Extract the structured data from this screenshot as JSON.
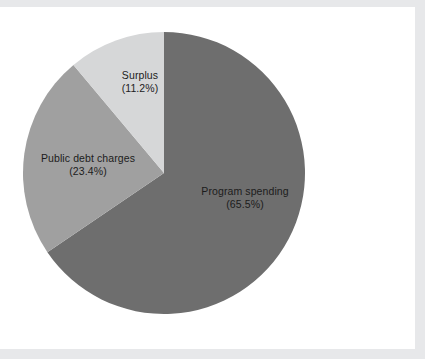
{
  "chart_data": {
    "type": "pie",
    "title": "",
    "subtitle": "",
    "xlabel": "",
    "ylabel": "",
    "legend_position": "none",
    "grid": false,
    "start_angle_deg": 0,
    "direction": "clockwise",
    "categories": [
      "Program spending",
      "Public debt charges",
      "Surplus"
    ],
    "values": [
      65.5,
      23.4,
      11.2
    ],
    "unit": "%",
    "slices": [
      {
        "name": "Program spending",
        "value": 65.5,
        "label_name": "Program spending",
        "label_pct": "(65.5%)",
        "color": "#6e6e6e",
        "start_deg": 0,
        "end_deg": 235.8
      },
      {
        "name": "Public debt charges",
        "value": 23.4,
        "label_name": "Public debt charges",
        "label_pct": "(23.4%)",
        "color": "#a0a0a0",
        "start_deg": 235.8,
        "end_deg": 320.04
      },
      {
        "name": "Surplus",
        "value": 11.2,
        "label_name": "Surplus",
        "label_pct": "(11.2%)",
        "color": "#d6d7d8",
        "start_deg": 320.04,
        "end_deg": 360
      }
    ]
  },
  "colors": {
    "program_spending": "#6e6e6e",
    "public_debt_charges": "#a0a0a0",
    "surplus": "#d6d7d8",
    "page_background": "#ffffff",
    "frame_band": "#e7e8ea",
    "label_text": "#1c1c1c"
  },
  "geometry": {
    "center_x": 164,
    "center_y": 166,
    "radius": 141
  }
}
